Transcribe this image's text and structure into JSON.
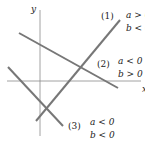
{
  "axes": {
    "x_label": "x",
    "y_label": "y",
    "color": "#888888"
  },
  "line_color": "#777777",
  "lines": [
    {
      "id": "1",
      "tag": "(1)",
      "cond_a": "a > 0",
      "cond_b": "b < 0"
    },
    {
      "id": "2",
      "tag": "(2)",
      "cond_a": "a < 0",
      "cond_b": "b > 0"
    },
    {
      "id": "3",
      "tag": "(3)",
      "cond_a": "a < 0",
      "cond_b": "b < 0"
    }
  ]
}
